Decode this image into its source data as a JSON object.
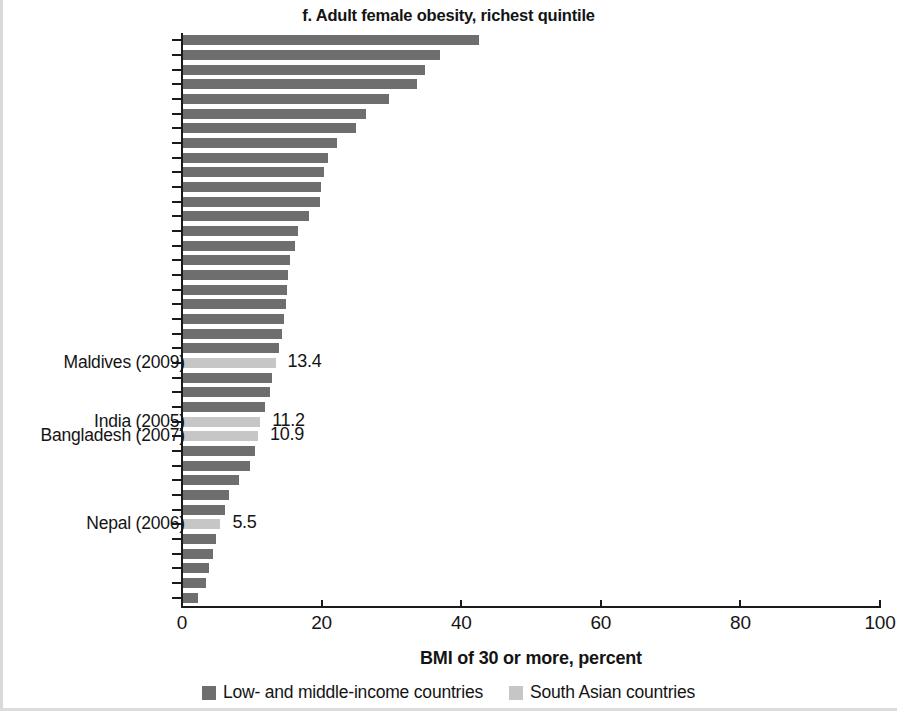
{
  "chart_data": {
    "type": "bar",
    "orientation": "horizontal",
    "title": "f. Adult female obesity, richest quintile",
    "xlabel": "BMI of 30 or more, percent",
    "ylabel": "",
    "xlim": [
      0,
      100
    ],
    "xticks": [
      0,
      20,
      40,
      60,
      80,
      100
    ],
    "xtick_labels": [
      "0",
      "20",
      "40",
      "60",
      "80",
      "100"
    ],
    "grid": false,
    "legend_position": "bottom",
    "legend": [
      {
        "label": "Low- and middle-income countries",
        "color": "#6e6e6e",
        "key": "lmic"
      },
      {
        "label": "South Asian countries",
        "color": "#c6c6c6",
        "key": "south"
      }
    ],
    "series": [
      {
        "name": "BMI of 30 or more, percent",
        "values": [
          42.6,
          36.9,
          34.8,
          33.7,
          29.6,
          26.3,
          24.9,
          22.2,
          20.9,
          20.3,
          19.9,
          19.8,
          18.2,
          16.6,
          16.2,
          15.5,
          15.2,
          15.1,
          14.9,
          14.6,
          14.3,
          13.9,
          13.4,
          12.9,
          12.6,
          11.9,
          11.2,
          10.9,
          10.4,
          9.8,
          8.2,
          6.7,
          6.1,
          5.5,
          4.9,
          4.4,
          3.8,
          3.4,
          2.3
        ]
      }
    ],
    "bar_groups": [
      "lmic",
      "lmic",
      "lmic",
      "lmic",
      "lmic",
      "lmic",
      "lmic",
      "lmic",
      "lmic",
      "lmic",
      "lmic",
      "lmic",
      "lmic",
      "lmic",
      "lmic",
      "lmic",
      "lmic",
      "lmic",
      "lmic",
      "lmic",
      "lmic",
      "lmic",
      "south",
      "lmic",
      "lmic",
      "lmic",
      "south",
      "south",
      "lmic",
      "lmic",
      "lmic",
      "lmic",
      "lmic",
      "south",
      "lmic",
      "lmic",
      "lmic",
      "lmic",
      "lmic"
    ],
    "annotations": [
      {
        "index": 22,
        "country": "Maldives (2009)",
        "value": "13.4"
      },
      {
        "index": 26,
        "country": "India (2005)",
        "value": "11.2"
      },
      {
        "index": 27,
        "country": "Bangladesh (2007)",
        "value": "10.9"
      },
      {
        "index": 33,
        "country": "Nepal (2006)",
        "value": "5.5"
      }
    ]
  }
}
